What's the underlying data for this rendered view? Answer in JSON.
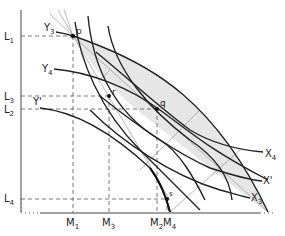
{
  "diagram": {
    "type": "edgeworth-box-contract-curve",
    "colors": {
      "ink": "#222222",
      "thin": "#777777",
      "shade": "#e6e6e6",
      "background": "#ffffff"
    },
    "axes": {
      "vertical_labels": [
        {
          "id": "L1",
          "main": "L",
          "sub": "1",
          "y": 36
        },
        {
          "id": "L3",
          "main": "L",
          "sub": "3",
          "y": 96
        },
        {
          "id": "L2",
          "main": "L",
          "sub": "2",
          "y": 109
        },
        {
          "id": "L4",
          "main": "L",
          "sub": "4",
          "y": 199
        }
      ],
      "horizontal_labels": [
        {
          "id": "M1",
          "main": "M",
          "sub": "1",
          "x": 73
        },
        {
          "id": "M3",
          "main": "M",
          "sub": "3",
          "x": 109
        },
        {
          "id": "M2",
          "main": "M",
          "sub": "2",
          "x": 157
        },
        {
          "id": "M4",
          "main": "M",
          "sub": "4",
          "x": 167
        }
      ]
    },
    "points": [
      {
        "id": "p",
        "label": "p",
        "x": 73,
        "y": 36
      },
      {
        "id": "r",
        "label": "r",
        "x": 109,
        "y": 96
      },
      {
        "id": "q",
        "label": "q",
        "x": 157,
        "y": 109
      },
      {
        "id": "s",
        "label": "s",
        "x": 167,
        "y": 199
      }
    ],
    "curve_labels": {
      "Y3": {
        "main": "Y",
        "sub": "3"
      },
      "Y4": {
        "main": "Y",
        "sub": "4"
      },
      "Yprime": {
        "main": "Y'",
        "sub": ""
      },
      "X4": {
        "main": "X",
        "sub": "4"
      },
      "Xprime": {
        "main": "X'",
        "sub": ""
      },
      "X3": {
        "main": "X",
        "sub": "3"
      }
    }
  }
}
